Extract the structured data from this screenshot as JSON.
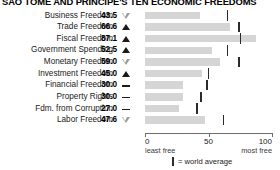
{
  "chart_data": {
    "type": "bar",
    "title": "SAO TOME AND PRINCIPE'S TEN ECONOMIC FREEDOMS",
    "xlabel": "",
    "ylabel": "",
    "xlim": [
      0,
      100
    ],
    "grid": false,
    "orientation": "horizontal",
    "categories": [
      "Business Freedom",
      "Trade Freedom",
      "Fiscal Freedom",
      "Government Spending",
      "Monetary Freedom",
      "Investment Freedom",
      "Financial Freedom",
      "Property Rights",
      "Fdm. from Corruption",
      "Labor Freedom"
    ],
    "values": [
      43.5,
      66.6,
      87.1,
      52.5,
      59.0,
      45.0,
      30.0,
      30.0,
      27.0,
      47.6
    ],
    "value_labels": [
      "43.5",
      "66.6",
      "87.1",
      "52.5",
      "59.0",
      "45.0",
      "30.0",
      "30.0",
      "27.0",
      "47.6"
    ],
    "trend": [
      "down",
      "up",
      "up",
      "up",
      "down",
      "up",
      "flat",
      "flat",
      "flat",
      "down"
    ],
    "world_average": [
      65,
      74,
      75,
      65,
      74,
      50,
      49,
      44,
      41,
      62
    ],
    "ticks": [
      0,
      50,
      100
    ],
    "tick_labels": [
      "0",
      "50",
      "100"
    ],
    "axis_end_labels": {
      "left": "least free",
      "right": "most free"
    },
    "legend": {
      "position": "bottom-center",
      "entries": [
        {
          "symbol": "vertical-bar",
          "label": "= world average"
        }
      ]
    },
    "colors": {
      "bar": "#d5d5d5",
      "average_tick": "#2b2b2b",
      "axis": "#6f6f6f",
      "text": "#1a1a1a",
      "trend_up": "#1a1a1a",
      "trend_down": "#9a9a9a"
    }
  },
  "legend_text": "= world average"
}
